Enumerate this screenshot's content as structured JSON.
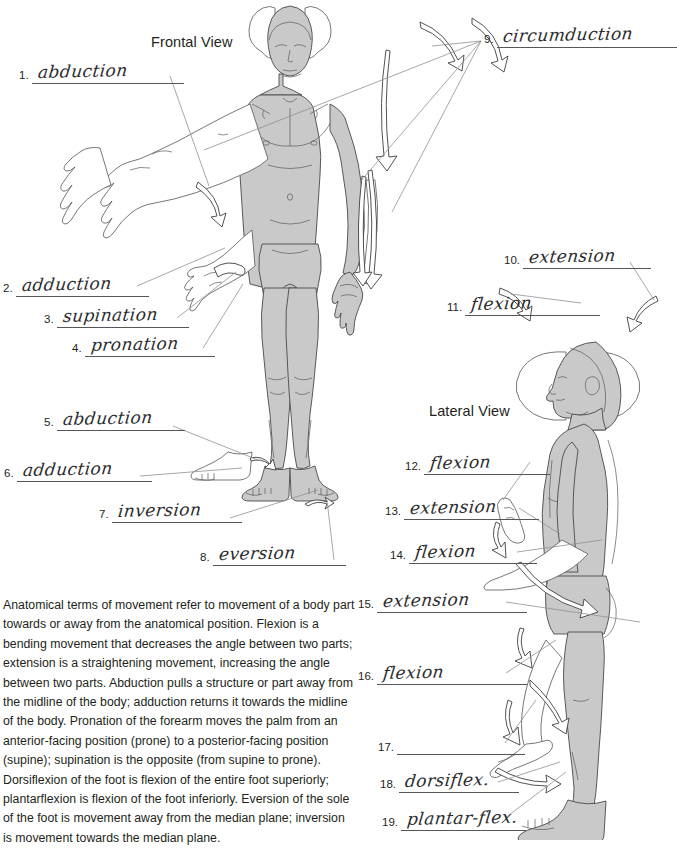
{
  "views": {
    "frontal_title": "Frontal View",
    "lateral_title": "Lateral View"
  },
  "answers": [
    {
      "number": "1.",
      "text": "abduction"
    },
    {
      "number": "2.",
      "text": "adduction"
    },
    {
      "number": "3.",
      "text": "supination"
    },
    {
      "number": "4.",
      "text": "pronation"
    },
    {
      "number": "5.",
      "text": "abduction"
    },
    {
      "number": "6.",
      "text": "adduction"
    },
    {
      "number": "7.",
      "text": "inversion"
    },
    {
      "number": "8.",
      "text": "eversion"
    },
    {
      "number": "9.",
      "text": "circumduction"
    },
    {
      "number": "10.",
      "text": "extension"
    },
    {
      "number": "11.",
      "text": "flexion"
    },
    {
      "number": "12.",
      "text": "flexion"
    },
    {
      "number": "13.",
      "text": "extension"
    },
    {
      "number": "14.",
      "text": "flexion"
    },
    {
      "number": "15.",
      "text": "extension"
    },
    {
      "number": "16.",
      "text": "flexion"
    },
    {
      "number": "17.",
      "text": ""
    },
    {
      "number": "18.",
      "text": "dorsiflex."
    },
    {
      "number": "19.",
      "text": "plantar-flex."
    }
  ],
  "description": "Anatomical terms of movement refer to movement of a body part towards or away from the anatomical position. Flexion is a bending movement that decreases the angle between two parts; extension is a straightening movement, increasing the angle between two parts. Abduction pulls a structure or part away from the midline of the body; adduction returns it towards the midline of the body. Pronation of the forearm moves the palm from an anterior-facing position (prone) to a posterior-facing position (supine); supination is the opposite (from supine to prone). Dorsiflexion of the foot is flexion of the entire foot superiorly; plantarflexion is flexion of the foot inferiorly. Eversion of the sole of the foot is movement away from the median plane; inversion is movement towards the median plane.",
  "colors": {
    "body_fill": "#c9c9c9",
    "outline": "#4a4a4a",
    "ink": "#2b2b2d",
    "leader_line": "#8a8a8a",
    "text": "#231f20"
  }
}
